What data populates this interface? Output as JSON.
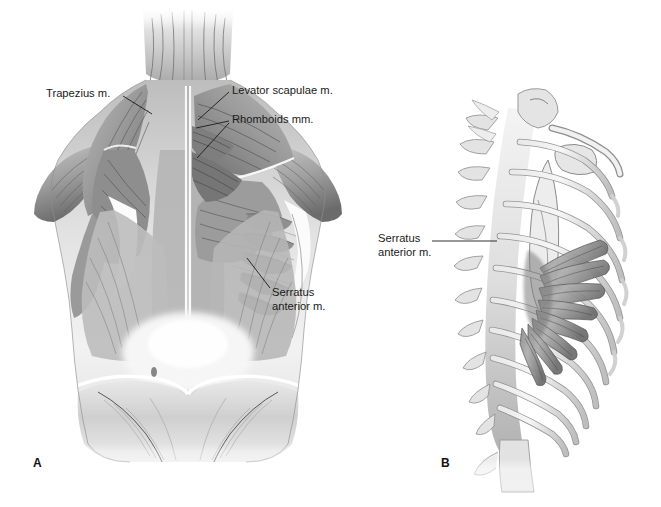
{
  "plate": {
    "title": "Muscles of the back and serratus anterior",
    "background_color": "#ffffff",
    "ink_color": "#1a1a1a",
    "width": 661,
    "height": 507
  },
  "panels": [
    {
      "id": "A",
      "letter": "A",
      "view": "posterior view of the back, superficial and deep muscle layers",
      "region": "upper back, scapulae, thoracolumbar fascia and gluteal region"
    },
    {
      "id": "B",
      "letter": "B",
      "view": "lateral view of the thoracic cage",
      "region": "ribs, thoracic vertebrae, scapula and clavicle with serratus anterior digitations"
    }
  ],
  "callouts": [
    {
      "id": "trapezius",
      "text": "Trapezius m.",
      "panel": "A",
      "label_x": 46,
      "label_y": 87,
      "leader_from_x": 123,
      "leader_from_y": 96,
      "leader_to_x": 152,
      "leader_to_y": 114
    },
    {
      "id": "levator-scapulae",
      "text": "Levator scapulae m.",
      "panel": "A",
      "label_x": 232,
      "label_y": 84,
      "leader_from_x": 229,
      "leader_from_y": 92,
      "leader_to_x": 198,
      "leader_to_y": 120
    },
    {
      "id": "rhomboids",
      "text": "Rhomboids mm.",
      "panel": "A",
      "label_x": 232,
      "label_y": 113,
      "leader_from_x": 229,
      "leader_from_y": 121,
      "leader_to_x": 196,
      "leader_to_y": 128,
      "second_leader_to_x": 197,
      "second_leader_to_y": 158
    },
    {
      "id": "serratus-anterior-a",
      "text": "Serratus\nanterior m.",
      "line1": "Serratus",
      "line2": "anterior m.",
      "panel": "A",
      "label_x": 272,
      "label_y": 286,
      "leader_from_x": 270,
      "leader_from_y": 288,
      "leader_to_x": 247,
      "leader_to_y": 258
    },
    {
      "id": "serratus-anterior-b",
      "text": "Serratus\nanterior m.",
      "line1": "Serratus",
      "line2": "anterior m.",
      "panel": "B",
      "label_x": 378,
      "label_y": 232,
      "leader_from_x": 432,
      "leader_from_y": 241,
      "leader_to_x": 497,
      "leader_to_y": 241
    }
  ],
  "anatomy": {
    "panel_a_structures": [
      "trapezius m.",
      "levator scapulae m.",
      "rhomboid major m.",
      "rhomboid minor m.",
      "serratus anterior m.",
      "latissimus dorsi m.",
      "infraspinatus m.",
      "teres major m.",
      "deltoid m.",
      "erector spinae group",
      "thoracolumbar fascia",
      "gluteus medius m.",
      "gluteus maximus m.",
      "iliac crest"
    ],
    "panel_b_structures": [
      "serratus anterior m. digitations",
      "ribs 1-10",
      "thoracic vertebrae",
      "scapula",
      "clavicle",
      "costal cartilage"
    ],
    "serratus_digitation_count": 8,
    "rib_count_visible": 10
  },
  "palette": {
    "paper": "#ffffff",
    "muscle_light": "#d8d8d8",
    "muscle_mid": "#a8a8a8",
    "muscle_dark": "#6f6f6f",
    "muscle_deep": "#4e4e4e",
    "bone_light": "#ebebeb",
    "bone_mid": "#c9c9c9",
    "bone_shadow": "#9a9a9a",
    "outline": "#3a3a3a",
    "leader": "#1a1a1a"
  }
}
